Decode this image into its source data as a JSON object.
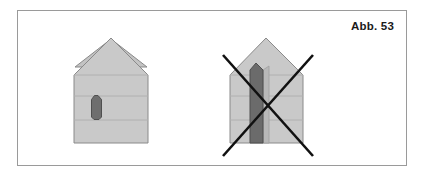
{
  "figure": {
    "caption": "Abb. 53",
    "panel": {
      "border_color": "#9a9a9a",
      "background": "#ffffff"
    },
    "colors": {
      "house_fill": "#c9c9c9",
      "roof_fill": "#c3c3c3",
      "outline": "#8a8a8a",
      "band_line": "#b0b0b0",
      "window_dark": "#6e6e6e",
      "window_outline": "#4f4f4f",
      "pillar_dark": "#6b6b6b",
      "pillar_light": "#b8b8b8",
      "cross_stroke": "#111111",
      "caption_text": "#1a1a1a"
    },
    "items": [
      {
        "id": "house-correct",
        "label": "house with small window",
        "status": "correct",
        "crossed_out": false,
        "apex": {
          "x": 146,
          "y": 38
        },
        "body": {
          "left": 110,
          "right": 182,
          "top": 74,
          "bottom": 143
        },
        "band_lines_y": [
          74,
          95,
          119
        ],
        "window": {
          "left": 126,
          "right": 137,
          "top": 95,
          "bottom": 119,
          "shape": "arched-vertical"
        }
      },
      {
        "id": "house-incorrect",
        "label": "house with oversized vertical opening",
        "status": "incorrect",
        "crossed_out": true,
        "apex": {
          "x": 265,
          "y": 38
        },
        "body": {
          "left": 229,
          "right": 302,
          "top": 74,
          "bottom": 143
        },
        "band_lines_y": [
          74,
          95,
          119
        ],
        "pillar": {
          "left": 249,
          "right": 262,
          "top": 66,
          "bottom": 143,
          "shape": "tall-vertical"
        },
        "pillar_highlight": {
          "left": 262,
          "right": 268,
          "top": 69,
          "bottom": 143
        },
        "cross": {
          "stroke_width": 2.6,
          "line_a": {
            "x1": 222,
            "y1": 54,
            "x2": 312,
            "y2": 155
          },
          "line_b": {
            "x1": 312,
            "y1": 54,
            "x2": 222,
            "y2": 155
          }
        }
      }
    ]
  }
}
